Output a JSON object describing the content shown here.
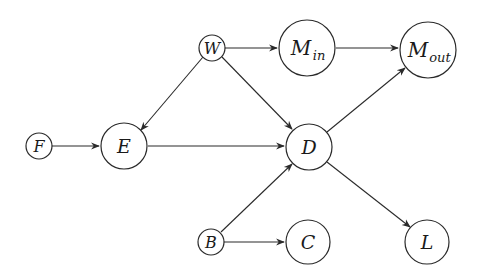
{
  "diagram": {
    "type": "directed-graph",
    "nodes": [
      {
        "id": "W",
        "label": "W",
        "sub": ""
      },
      {
        "id": "Min",
        "label": "M",
        "sub": "in"
      },
      {
        "id": "Mout",
        "label": "M",
        "sub": "out"
      },
      {
        "id": "F",
        "label": "F",
        "sub": ""
      },
      {
        "id": "E",
        "label": "E",
        "sub": ""
      },
      {
        "id": "D",
        "label": "D",
        "sub": ""
      },
      {
        "id": "B",
        "label": "B",
        "sub": ""
      },
      {
        "id": "C",
        "label": "C",
        "sub": ""
      },
      {
        "id": "L",
        "label": "L",
        "sub": ""
      }
    ],
    "edges": [
      {
        "from": "W",
        "to": "Min"
      },
      {
        "from": "Min",
        "to": "Mout"
      },
      {
        "from": "W",
        "to": "E"
      },
      {
        "from": "W",
        "to": "D"
      },
      {
        "from": "F",
        "to": "E"
      },
      {
        "from": "E",
        "to": "D"
      },
      {
        "from": "D",
        "to": "Mout"
      },
      {
        "from": "B",
        "to": "D"
      },
      {
        "from": "B",
        "to": "C"
      },
      {
        "from": "D",
        "to": "L"
      }
    ]
  }
}
